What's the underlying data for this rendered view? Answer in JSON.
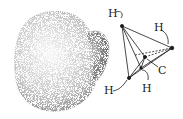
{
  "diagram": {
    "space_filling_model": {
      "description": "stippled electron-cloud model"
    },
    "tetrahedral_model": {
      "atoms": [
        {
          "label": "H",
          "x": 122,
          "y": 26,
          "label_x": 108,
          "label_y": 17
        },
        {
          "label": "H",
          "x": 172,
          "y": 48,
          "label_x": 154,
          "label_y": 31
        },
        {
          "label": "H",
          "x": 129,
          "y": 78,
          "label_x": 106,
          "label_y": 94
        },
        {
          "label": "H",
          "x": 141,
          "y": 68,
          "label_x": 142,
          "label_y": 92
        },
        {
          "label": "C",
          "x": 145,
          "y": 57,
          "label_x": 158,
          "label_y": 73
        }
      ]
    },
    "colors": {
      "ink": "#1a1a1a",
      "background": "#ffffff"
    }
  }
}
